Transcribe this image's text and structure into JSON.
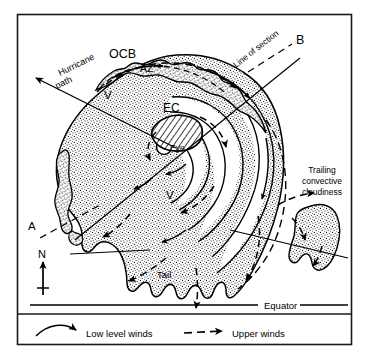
{
  "figure": {
    "kind": "hurricane-structure-schematic",
    "frame": {
      "x": 17,
      "y": 14,
      "width": 335,
      "height": 331,
      "border_color": "#1a1a1a"
    },
    "background_color": "#ffffff",
    "ink_color": "#000000",
    "stipple_fill_color": "#000000"
  },
  "labels": {
    "ocb": "OCB",
    "az": "AZ",
    "ec": "EC",
    "eye": "Eye",
    "v_upper": "V",
    "v_lower": "V",
    "tail": "Tail",
    "point_a": "A",
    "point_b": "B",
    "line_of_section": "Line of section",
    "hurricane_path_line1": "Hurricane",
    "hurricane_path_line2": "path",
    "trailing_line1": "Trailing",
    "trailing_line2": "convective",
    "trailing_line3": "cloudiness",
    "equator": "Equator",
    "north": "N"
  },
  "legend": {
    "items": [
      {
        "id": "low-level-winds",
        "label": "Low level winds",
        "style": "solid-curved-arrow"
      },
      {
        "id": "upper-winds",
        "label": "Upper winds",
        "style": "dashed-arrow"
      }
    ]
  },
  "compass": {
    "label": "N",
    "direction": "up"
  },
  "icons": {
    "north_arrow": "north-arrow-icon",
    "solid_arrow": "solid-arrow-icon",
    "dashed_arrow": "dashed-arrow-icon"
  }
}
